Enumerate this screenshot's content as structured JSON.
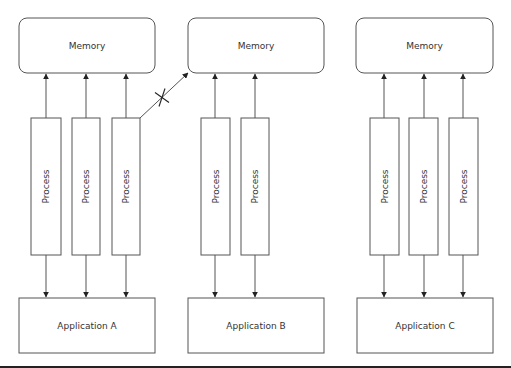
{
  "diagram": {
    "type": "architecture",
    "colors": {
      "stroke": "#555555",
      "text": "#333333",
      "background": "#ffffff",
      "rule": "#222222"
    },
    "groups": [
      {
        "id": "A",
        "memory": {
          "label": "Memory",
          "x": 19,
          "y": 18,
          "w": 136,
          "h": 55
        },
        "application": {
          "label": "Application A",
          "x": 19,
          "y": 298,
          "w": 136,
          "h": 55
        },
        "processes": [
          {
            "label": "Process",
            "x": 31,
            "w": 30,
            "cx": 46
          },
          {
            "label": "Process",
            "x": 72,
            "w": 28,
            "cx": 86
          },
          {
            "label": "Process",
            "x": 112,
            "w": 28,
            "cx": 126
          }
        ]
      },
      {
        "id": "B",
        "memory": {
          "label": "Memory",
          "x": 188,
          "y": 18,
          "w": 136,
          "h": 55
        },
        "application": {
          "label": "Application B",
          "x": 188,
          "y": 298,
          "w": 136,
          "h": 55
        },
        "processes": [
          {
            "label": "Process",
            "x": 201,
            "w": 29,
            "cx": 215
          },
          {
            "label": "Process",
            "x": 241,
            "w": 28,
            "cx": 255
          }
        ]
      },
      {
        "id": "C",
        "memory": {
          "label": "Memory",
          "x": 356,
          "y": 18,
          "w": 137,
          "h": 55
        },
        "application": {
          "label": "Application C",
          "x": 357,
          "y": 298,
          "w": 136,
          "h": 55
        },
        "processes": [
          {
            "label": "Process",
            "x": 370,
            "w": 29,
            "cx": 384
          },
          {
            "label": "Process",
            "x": 409,
            "w": 29,
            "cx": 424
          },
          {
            "label": "Process",
            "x": 449,
            "w": 29,
            "cx": 463
          }
        ]
      }
    ],
    "process_top": 118,
    "process_bottom": 255,
    "blocked_access": {
      "from": "Application A / Process 3",
      "to": "Memory B",
      "marker": "X",
      "x1": 140,
      "y1": 118,
      "x2": 188,
      "y2": 73
    }
  }
}
